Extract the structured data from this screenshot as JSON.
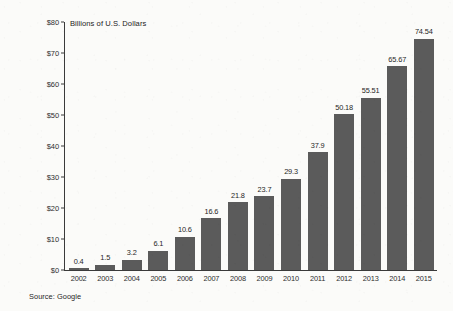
{
  "chart_data": {
    "type": "bar",
    "title": "Billions of U.S. Dollars",
    "xlabel": "",
    "ylabel": "Billions of U.S. Dollars",
    "ylim": [
      0,
      80
    ],
    "grid": false,
    "legend": null,
    "source_note": "Source: Google",
    "bar_color": "#5b5b5b",
    "background_color": "#fbfbf9",
    "axis_color": "#3a3a3a",
    "y_ticks": [
      "$0",
      "$10",
      "$20",
      "$30",
      "$40",
      "$50",
      "$60",
      "$70",
      "$80"
    ],
    "y_tick_values": [
      0,
      10,
      20,
      30,
      40,
      50,
      60,
      70,
      80
    ],
    "categories": [
      "2002",
      "2003",
      "2004",
      "2005",
      "2006",
      "2007",
      "2008",
      "2009",
      "2010",
      "2011",
      "2012",
      "2013",
      "2014",
      "2015"
    ],
    "values": [
      0.4,
      1.5,
      3.2,
      6.1,
      10.6,
      16.6,
      21.8,
      23.7,
      29.3,
      37.9,
      50.18,
      55.51,
      65.67,
      74.54
    ],
    "value_labels": [
      "0.4",
      "1.5",
      "3.2",
      "6.1",
      "10.6",
      "16.6",
      "21.8",
      "23.7",
      "29.3",
      "37.9",
      "50.18",
      "55.51",
      "65.67",
      "74.54"
    ]
  }
}
